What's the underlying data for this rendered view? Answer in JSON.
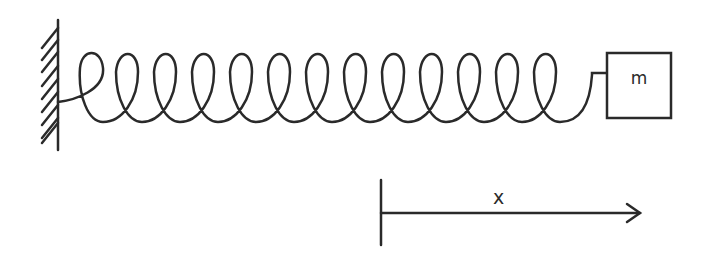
{
  "diagram": {
    "type": "spring-mass-system",
    "colors": {
      "stroke": "#2a2a2a",
      "background": "#ffffff"
    },
    "wall": {
      "icon": "hatched-wall-icon",
      "hatch_count": 10
    },
    "spring": {
      "icon": "coil-spring-icon",
      "loop_count": 13
    },
    "mass": {
      "label": "m"
    },
    "displacement": {
      "label": "x",
      "icon": "arrow-right-icon"
    }
  }
}
